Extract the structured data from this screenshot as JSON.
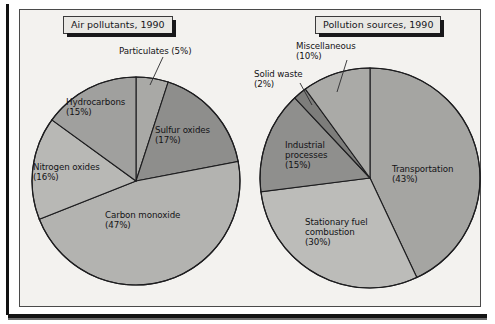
{
  "figure": {
    "background_color": "#f3f2ef",
    "frame_color": "#4a4a4a"
  },
  "charts": [
    {
      "id": "air-pollutants",
      "title": "Air pollutants, 1990",
      "title_pos": {
        "x": 63,
        "y": 16
      },
      "center": {
        "x": 136,
        "y": 181
      },
      "radius": 104,
      "labels": [
        {
          "name": "particulates",
          "text": "Particulates (5%)",
          "x": 119,
          "y": 47,
          "leader": [
            [
              163,
              57
            ],
            [
              150,
              85
            ]
          ]
        },
        {
          "name": "sulfur-oxides",
          "text": "Sulfur oxides\n(17%)",
          "x": 155,
          "y": 126,
          "leader": null
        },
        {
          "name": "hydrocarbons",
          "text": "Hydrocarbons\n(15%)",
          "x": 66,
          "y": 98,
          "leader": null
        },
        {
          "name": "nitrogen-oxides",
          "text": "Nitrogen oxides\n(16%)",
          "x": 33,
          "y": 163,
          "leader": null
        },
        {
          "name": "carbon-monoxide",
          "text": "Carbon monoxide\n(47%)",
          "x": 105,
          "y": 211,
          "leader": null
        }
      ],
      "chart_data": {
        "type": "pie",
        "title": "Air pollutants, 1990",
        "unit": "percent",
        "start_angle_deg": 0,
        "direction": "clockwise",
        "categories": [
          "Particulates",
          "Sulfur oxides",
          "Carbon monoxide",
          "Nitrogen oxides",
          "Hydrocarbons"
        ],
        "values": [
          5,
          17,
          47,
          16,
          15
        ],
        "colors": [
          "#a9a9a6",
          "#8e8e8c",
          "#b3b3b0",
          "#b8b8b5",
          "#a0a09e"
        ],
        "legend": "inline-labels"
      }
    },
    {
      "id": "pollution-sources",
      "title": "Pollution sources, 1990",
      "title_pos": {
        "x": 315,
        "y": 16
      },
      "center": {
        "x": 370,
        "y": 178
      },
      "radius": 110,
      "labels": [
        {
          "name": "miscellaneous",
          "text": "Miscellaneous\n(10%)",
          "x": 296,
          "y": 42,
          "leader": [
            [
              347,
              60
            ],
            [
              337,
              92
            ]
          ]
        },
        {
          "name": "solid-waste",
          "text": "Solid waste\n(2%)",
          "x": 254,
          "y": 70,
          "leader": [
            [
              300,
              83
            ],
            [
              312,
              105
            ]
          ]
        },
        {
          "name": "industrial-processes",
          "text": "Industrial\nprocesses\n(15%)",
          "x": 285,
          "y": 141,
          "leader": null
        },
        {
          "name": "transportation",
          "text": "Transportation\n(43%)",
          "x": 392,
          "y": 165,
          "leader": null
        },
        {
          "name": "stationary-fuel",
          "text": "Stationary fuel\ncombustion\n(30%)",
          "x": 305,
          "y": 218,
          "leader": null
        }
      ],
      "chart_data": {
        "type": "pie",
        "title": "Pollution sources, 1990",
        "unit": "percent",
        "start_angle_deg": 0,
        "direction": "clockwise",
        "categories": [
          "Transportation",
          "Stationary fuel combustion",
          "Industrial processes",
          "Solid waste",
          "Miscellaneous"
        ],
        "values": [
          43,
          30,
          15,
          2,
          10
        ],
        "colors": [
          "#a5a5a2",
          "#bcbcb9",
          "#8f8f8d",
          "#7d7d7b",
          "#aaaaa7"
        ],
        "legend": "inline-labels"
      }
    }
  ]
}
